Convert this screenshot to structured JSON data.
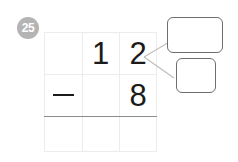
{
  "worksheet": {
    "problem_number": "25",
    "badge_color": "#b4b4b4",
    "grid": {
      "columns": 3,
      "rows": 3,
      "line_color": "#ececed",
      "answer_rule_color": "#8c8c8c"
    },
    "cells": {
      "row1_col1": "",
      "row1_col2": "1",
      "row1_col3": "2",
      "row2_col1": "−",
      "row2_col2": "",
      "row2_col3": "8",
      "row3_col1": "",
      "row3_col2": "",
      "row3_col3": ""
    },
    "problem": {
      "minuend": "12",
      "subtrahend": "8",
      "operator": "−",
      "difference": ""
    },
    "answer_boxes": [
      {
        "id": "top-box",
        "value": "",
        "shape": "rounded-rect-wide"
      },
      {
        "id": "bottom-box",
        "value": "",
        "shape": "rounded-square"
      }
    ],
    "connector": {
      "color": "#bdbdbd",
      "label": "decomposition-pointer"
    }
  }
}
